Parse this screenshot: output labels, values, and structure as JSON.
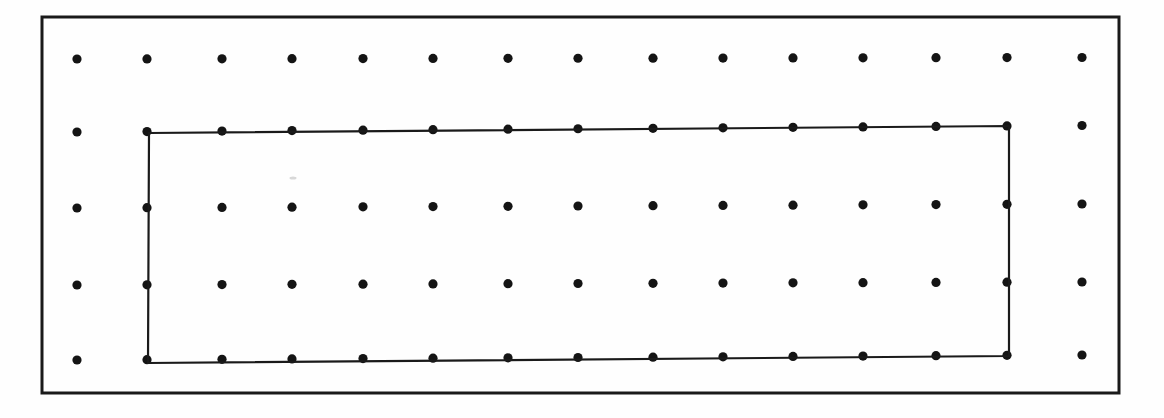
{
  "document": {
    "kind": "scanned-figure",
    "title": "Dot lattice with inscribed rectangle",
    "background_color": "#fefefe",
    "ink_color": "#1a1a1a",
    "width": 1164,
    "height": 418
  },
  "outer_frame": {
    "name": "page-border",
    "stroke_color": "#1a1a1a",
    "stroke_width": 3,
    "x": 42,
    "y": 17,
    "width": 1077,
    "height": 376
  },
  "dot_grid": {
    "name": "dot-lattice",
    "columns": 15,
    "rows": 5,
    "dot_radius": 4.6,
    "dot_color": "#141414",
    "column_x": [
      77,
      147,
      222,
      292,
      363,
      433,
      508,
      578,
      653,
      723,
      793,
      863,
      936,
      1007,
      1082
    ],
    "row_y": [
      59,
      132,
      208,
      285,
      360
    ],
    "row_tilt": [
      -1.5,
      -6.5,
      -4.0,
      -3.0,
      -5.0
    ],
    "total_dots": 75
  },
  "inner_rectangle": {
    "name": "inscribed-rectangle",
    "stroke_color": "#1a1a1a",
    "stroke_width": 2.2,
    "corners": [
      {
        "label": "top-left",
        "x": 149,
        "y": 133
      },
      {
        "label": "top-right",
        "x": 1009,
        "y": 126
      },
      {
        "label": "bottom-right",
        "x": 1009,
        "y": 356
      },
      {
        "label": "bottom-left",
        "x": 148,
        "y": 363
      }
    ],
    "vertices_on_lattice": true,
    "spans_columns": [
      2,
      14
    ],
    "spans_rows": [
      2,
      4
    ],
    "edge_dot_count_top": 13,
    "edge_dot_count_bottom": 13,
    "edge_dot_count_left": 3,
    "edge_dot_count_right": 3
  },
  "artifacts": [
    {
      "name": "scan-speck",
      "x": 293,
      "y": 178,
      "width": 7,
      "height": 3,
      "color": "#d8d8d8"
    }
  ]
}
